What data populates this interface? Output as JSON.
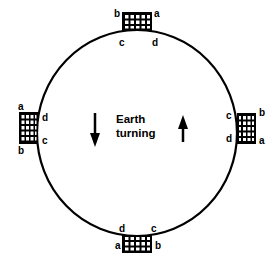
{
  "diagram": {
    "center_label": [
      "Earth",
      "turning"
    ],
    "arrows": [
      {
        "id": "left-arrow",
        "direction": "down"
      },
      {
        "id": "right-arrow",
        "direction": "up"
      }
    ],
    "grids": {
      "top": {
        "corners": {
          "top_left": "b",
          "top_right": "a",
          "bottom_left": "c",
          "bottom_right": "d"
        }
      },
      "left": {
        "corners": {
          "top_left": "a",
          "bottom_left": "b",
          "top_right": "d",
          "bottom_right": "c"
        }
      },
      "right": {
        "corners": {
          "top_left": "c",
          "top_right": "b",
          "bottom_left": "d",
          "bottom_right": "a"
        }
      },
      "bottom": {
        "corners": {
          "top_left": "d",
          "top_right": "c",
          "bottom_left": "a",
          "bottom_right": "b"
        }
      }
    },
    "colors": {
      "stroke": "#000000",
      "background": "#ffffff"
    }
  }
}
